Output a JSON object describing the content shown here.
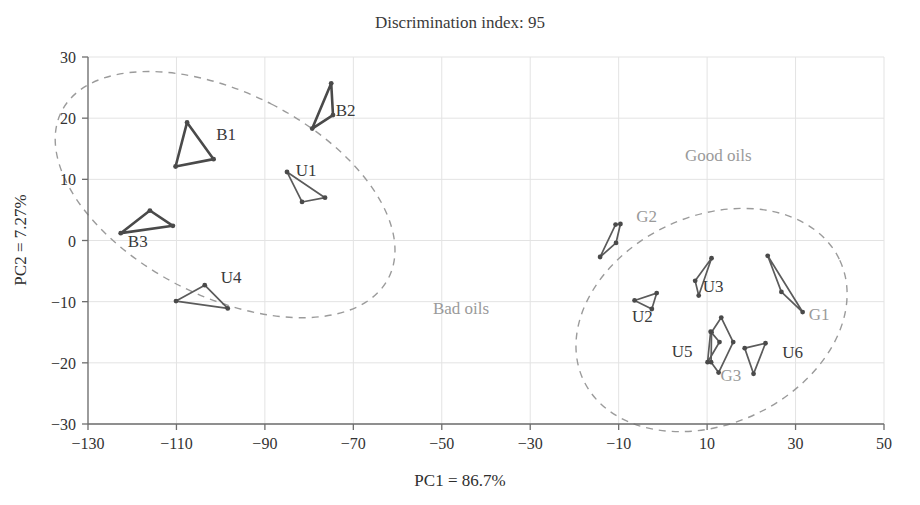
{
  "chart_data": {
    "type": "scatter",
    "title": "Discrimination index: 95",
    "xlabel": "PC1 = 86.7%",
    "ylabel": "PC2 = 7.27%",
    "xlim": [
      -130,
      50
    ],
    "ylim": [
      -30,
      30
    ],
    "xticks": [
      "-130",
      "-110",
      "-90",
      "-70",
      "-50",
      "-30",
      "-10",
      "10",
      "30",
      "50"
    ],
    "xtick_values": [
      -130,
      -110,
      -90,
      -70,
      -50,
      -30,
      -10,
      10,
      30,
      50
    ],
    "yticks": [
      "30",
      "20",
      "10",
      "0",
      "-10",
      "-20",
      "-30"
    ],
    "ytick_values": [
      30,
      20,
      10,
      0,
      -10,
      -20,
      -30
    ],
    "grid": true,
    "legend": "none",
    "annotations": [
      {
        "text": "Bad oils",
        "x": -52,
        "y": -12,
        "color": "#9a9a9a"
      },
      {
        "text": "Good oils",
        "x": 5,
        "y": 13,
        "color": "#9a9a9a"
      }
    ],
    "confidence_ellipses": [
      {
        "name": "Bad oils",
        "cx": -99,
        "cy": 7.5,
        "rx": 23,
        "ry": 30,
        "rotation": -63,
        "style": "dashed"
      },
      {
        "name": "Good oils",
        "cx": 11,
        "cy": -13,
        "rx": 32,
        "ry": 17,
        "rotation": -25,
        "style": "dashed"
      }
    ],
    "groups": [
      {
        "name": "B1",
        "cluster": "Bad oils",
        "label_x": -101,
        "label_y": 16.5,
        "emphasis": "heavy",
        "points": [
          {
            "x": -107.6,
            "y": 19.3
          },
          {
            "x": -110.2,
            "y": 12.1
          },
          {
            "x": -101.6,
            "y": 13.3
          }
        ]
      },
      {
        "name": "B2",
        "cluster": "Bad oils",
        "label_x": -74,
        "label_y": 20.3,
        "emphasis": "heavy",
        "points": [
          {
            "x": -75.0,
            "y": 25.7
          },
          {
            "x": -74.6,
            "y": 20.5
          },
          {
            "x": -79.3,
            "y": 18.3
          }
        ]
      },
      {
        "name": "B3",
        "cluster": "Bad oils",
        "label_x": -121,
        "label_y": -1.0,
        "emphasis": "heavy",
        "points": [
          {
            "x": -122.6,
            "y": 1.2
          },
          {
            "x": -116.0,
            "y": 4.9
          },
          {
            "x": -110.8,
            "y": 2.4
          }
        ]
      },
      {
        "name": "U1",
        "cluster": "Bad oils",
        "label_x": -83,
        "label_y": 10.5,
        "emphasis": "normal",
        "points": [
          {
            "x": -85.0,
            "y": 11.2
          },
          {
            "x": -81.6,
            "y": 6.3
          },
          {
            "x": -76.4,
            "y": 7.0
          }
        ]
      },
      {
        "name": "U4",
        "cluster": "Bad oils",
        "label_x": -100,
        "label_y": -7.0,
        "emphasis": "normal",
        "points": [
          {
            "x": -110.1,
            "y": -9.9
          },
          {
            "x": -103.6,
            "y": -7.3
          },
          {
            "x": -98.4,
            "y": -11.1
          }
        ]
      },
      {
        "name": "G1",
        "cluster": "Good oils",
        "label_x": 33,
        "label_y": -13.0,
        "emphasis": "normal",
        "points": [
          {
            "x": 23.7,
            "y": -2.5
          },
          {
            "x": 26.8,
            "y": -8.4
          },
          {
            "x": 31.6,
            "y": -11.7
          }
        ]
      },
      {
        "name": "G2",
        "cluster": "Good oils",
        "label_x": -6,
        "label_y": 3.0,
        "emphasis": "normal",
        "points": [
          {
            "x": -10.7,
            "y": 2.6
          },
          {
            "x": -9.6,
            "y": 2.7
          },
          {
            "x": -10.6,
            "y": -0.4
          },
          {
            "x": -14.2,
            "y": -2.7
          }
        ]
      },
      {
        "name": "G3",
        "cluster": "Good oils",
        "label_x": 13,
        "label_y": -23.0,
        "emphasis": "normal",
        "points": [
          {
            "x": 13.2,
            "y": -12.6
          },
          {
            "x": 15.9,
            "y": -16.6
          },
          {
            "x": 12.6,
            "y": -21.6
          },
          {
            "x": 10.9,
            "y": -19.9
          },
          {
            "x": 11.0,
            "y": -15.0
          }
        ]
      },
      {
        "name": "U2",
        "cluster": "Good oils",
        "label_x": -7,
        "label_y": -13.4,
        "emphasis": "normal",
        "points": [
          {
            "x": -6.4,
            "y": -9.8
          },
          {
            "x": -1.4,
            "y": -8.6
          },
          {
            "x": -2.5,
            "y": -11.2
          }
        ]
      },
      {
        "name": "U3",
        "cluster": "Good oils",
        "label_x": 9,
        "label_y": -8.4,
        "emphasis": "normal",
        "points": [
          {
            "x": 7.3,
            "y": -6.6
          },
          {
            "x": 11.0,
            "y": -2.9
          },
          {
            "x": 8.1,
            "y": -9.0
          }
        ]
      },
      {
        "name": "U5",
        "cluster": "Good oils",
        "label_x": 2,
        "label_y": -19.0,
        "emphasis": "normal",
        "points": [
          {
            "x": 10.8,
            "y": -14.9
          },
          {
            "x": 12.8,
            "y": -16.6
          },
          {
            "x": 10.1,
            "y": -19.9
          }
        ]
      },
      {
        "name": "U6",
        "cluster": "Good oils",
        "label_x": 27,
        "label_y": -19.2,
        "emphasis": "normal",
        "points": [
          {
            "x": 18.5,
            "y": -17.6
          },
          {
            "x": 23.2,
            "y": -16.8
          },
          {
            "x": 20.5,
            "y": -21.8
          }
        ]
      }
    ]
  }
}
